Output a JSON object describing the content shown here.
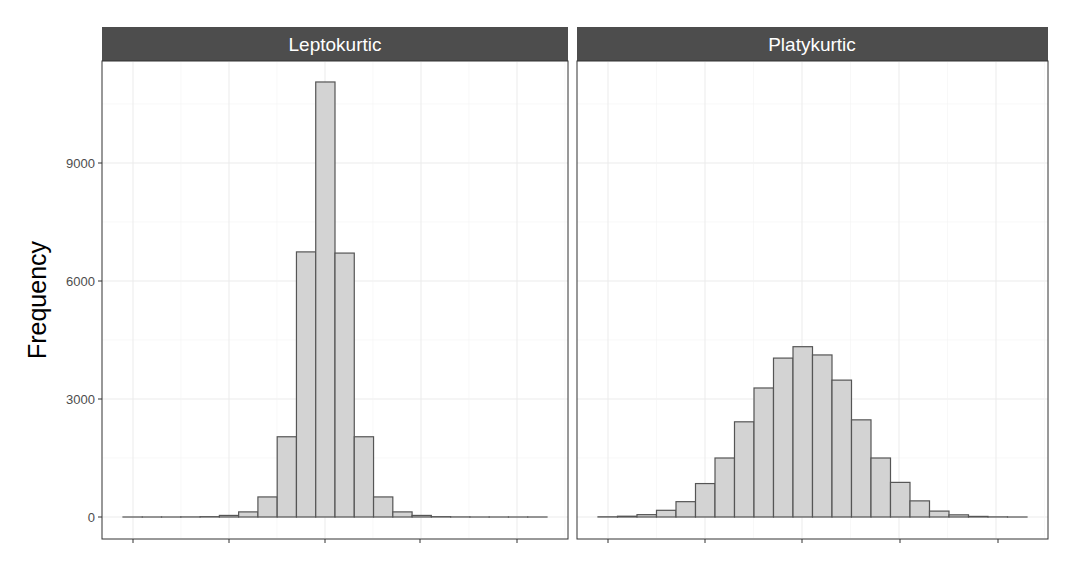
{
  "chart_data": {
    "type": "bar",
    "subtype": "faceted_histogram",
    "xlabel": "",
    "ylabel": "Frequency",
    "ylim": [
      -700,
      11600
    ],
    "yticks": [
      0,
      3000,
      6000,
      9000
    ],
    "ytick_labels": [
      "0",
      "3000",
      "6000",
      "9000"
    ],
    "x_tick_labels_shown": false,
    "grid": true,
    "legend": null,
    "colors": {
      "strip_bg": "#4d4d4d",
      "strip_text": "#ffffff",
      "bar_fill": "#d3d3d3",
      "bar_stroke": "#555555",
      "panel_border": "#333333",
      "grid_major": "#ebebeb",
      "grid_minor": "#f4f4f4"
    },
    "panels": [
      {
        "title": "Leptokurtic",
        "bins": 22,
        "values": [
          0,
          0,
          0,
          2,
          8,
          40,
          130,
          510,
          2040,
          6740,
          11060,
          6710,
          2040,
          510,
          130,
          40,
          8,
          2,
          0,
          0,
          0,
          0
        ]
      },
      {
        "title": "Platykurtic",
        "bins": 22,
        "values": [
          5,
          20,
          60,
          170,
          390,
          850,
          1500,
          2420,
          3280,
          4040,
          4330,
          4120,
          3480,
          2470,
          1500,
          880,
          410,
          150,
          55,
          15,
          3,
          0
        ]
      }
    ]
  },
  "facets": {
    "left_title": "Leptokurtic",
    "right_title": "Platykurtic"
  },
  "axis": {
    "y_title": "Frequency"
  }
}
